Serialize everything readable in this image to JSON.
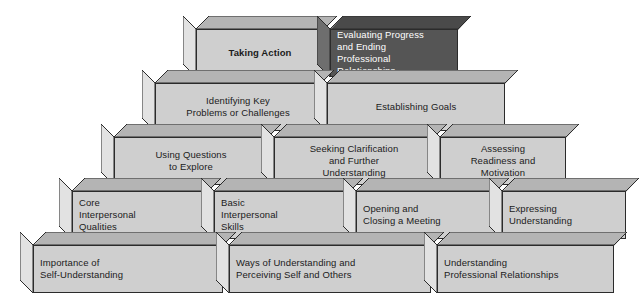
{
  "diagram": {
    "type": "stacked-pyramid",
    "colors": {
      "block_front": "#cfcfcf",
      "block_side": "#e2e2e2",
      "block_top": "#b4b4b4",
      "block_outline": "#2b2b2b",
      "highlight_front": "#555555",
      "highlight_side": "#6e6e6e",
      "highlight_top": "#4a4a4a",
      "text": "#1b1b1b",
      "highlight_text": "#ffffff",
      "background": "#ffffff"
    },
    "rows": [
      {
        "level": 5,
        "blocks": [
          {
            "id": "taking-action",
            "label": "Taking Action",
            "bold": true,
            "align": "center",
            "highlight": false
          },
          {
            "id": "evaluating-progress",
            "label": "Evaluating Progress\nand Ending\nProfessional\nRelationships",
            "bold": false,
            "align": "left",
            "highlight": true
          }
        ]
      },
      {
        "level": 4,
        "blocks": [
          {
            "id": "identifying-key-problems",
            "label": "Identifying Key\nProblems or Challenges",
            "bold": false,
            "align": "center",
            "highlight": false
          },
          {
            "id": "establishing-goals",
            "label": "Establishing Goals",
            "bold": false,
            "align": "center",
            "highlight": false
          }
        ]
      },
      {
        "level": 3,
        "blocks": [
          {
            "id": "using-questions",
            "label": "Using Questions\nto Explore",
            "bold": false,
            "align": "center",
            "highlight": false
          },
          {
            "id": "seeking-clarification",
            "label": "Seeking Clarification\nand Further\nUnderstanding",
            "bold": false,
            "align": "center",
            "highlight": false
          },
          {
            "id": "assessing-readiness",
            "label": "Assessing\nReadiness and\nMotivation",
            "bold": false,
            "align": "center",
            "highlight": false
          }
        ]
      },
      {
        "level": 2,
        "blocks": [
          {
            "id": "core-interpersonal-qualities",
            "label": "Core\nInterpersonal\nQualities",
            "bold": false,
            "align": "left",
            "highlight": false
          },
          {
            "id": "basic-interpersonal-skills",
            "label": "Basic\nInterpersonal\nSkills",
            "bold": false,
            "align": "left",
            "highlight": false
          },
          {
            "id": "opening-closing-meeting",
            "label": "Opening and\nClosing a Meeting",
            "bold": false,
            "align": "left",
            "highlight": false
          },
          {
            "id": "expressing-understanding",
            "label": "Expressing\nUnderstanding",
            "bold": false,
            "align": "left",
            "highlight": false
          }
        ]
      },
      {
        "level": 1,
        "blocks": [
          {
            "id": "importance-self-understanding",
            "label": "Importance of\nSelf-Understanding",
            "bold": false,
            "align": "left",
            "highlight": false
          },
          {
            "id": "ways-of-understanding",
            "label": "Ways of Understanding and\nPerceiving Self and Others",
            "bold": false,
            "align": "left",
            "highlight": false
          },
          {
            "id": "understanding-professional-relationships",
            "label": "Understanding\nProfessional Relationships",
            "bold": false,
            "align": "left",
            "highlight": false
          }
        ]
      }
    ],
    "geometry": {
      "depth_x": 13,
      "depth_y": 13,
      "rows": [
        {
          "top": 29,
          "height": 48,
          "blocks": [
            {
              "x": 196,
              "w": 128
            },
            {
              "x": 330,
              "w": 128
            }
          ]
        },
        {
          "top": 83,
          "height": 48,
          "blocks": [
            {
              "x": 155,
              "w": 166
            },
            {
              "x": 327,
              "w": 178
            }
          ]
        },
        {
          "top": 137,
          "height": 48,
          "blocks": [
            {
              "x": 114,
              "w": 154
            },
            {
              "x": 274,
              "w": 160
            },
            {
              "x": 440,
              "w": 126
            }
          ]
        },
        {
          "top": 191,
          "height": 48,
          "blocks": [
            {
              "x": 72,
              "w": 136
            },
            {
              "x": 214,
              "w": 136
            },
            {
              "x": 356,
              "w": 140
            },
            {
              "x": 502,
              "w": 124
            }
          ]
        },
        {
          "top": 245,
          "height": 48,
          "blocks": [
            {
              "x": 33,
              "w": 190
            },
            {
              "x": 229,
              "w": 202
            },
            {
              "x": 437,
              "w": 177
            }
          ]
        }
      ]
    }
  }
}
